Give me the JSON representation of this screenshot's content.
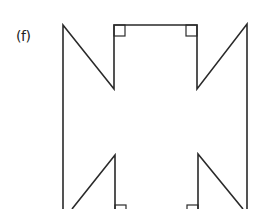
{
  "figure": {
    "label": "(f)",
    "right_angle_markers": 4
  }
}
